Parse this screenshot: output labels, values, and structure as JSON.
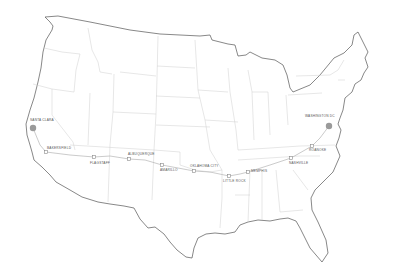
{
  "map": {
    "title": "Cross-country route map",
    "colors": {
      "background": "#ffffff",
      "coast": "#555555",
      "state_border": "#cfcfcf",
      "route": "#b5b5b5",
      "stop": "#8a8a8a",
      "endpoint": "#9a9a9a",
      "label": "#555555"
    },
    "label_note": "Stop names are inferred from blurred pixels and not legible with certainty",
    "endpoints": [
      {
        "name": "Santa Clara",
        "x": 33,
        "y": 128,
        "label_x": 30,
        "label_y": 119
      },
      {
        "name": "Washington DC",
        "x": 329,
        "y": 126,
        "label_x": 305,
        "label_y": 115
      }
    ],
    "stops": [
      {
        "name": "Bakersfield",
        "x": 46,
        "y": 152,
        "label_x": 47,
        "label_y": 148
      },
      {
        "name": "Flagstaff",
        "x": 94,
        "y": 157,
        "label_x": 90,
        "label_y": 162
      },
      {
        "name": "Albuquerque",
        "x": 129,
        "y": 159,
        "label_x": 129,
        "label_y": 154
      },
      {
        "name": "Amarillo",
        "x": 162,
        "y": 165,
        "label_x": 161,
        "label_y": 169
      },
      {
        "name": "Oklahoma City",
        "x": 194,
        "y": 171,
        "label_x": 191,
        "label_y": 166
      },
      {
        "name": "Little Rock",
        "x": 229,
        "y": 176,
        "label_x": 224,
        "label_y": 180
      },
      {
        "name": "Memphis",
        "x": 248,
        "y": 172,
        "label_x": 251,
        "label_y": 171
      },
      {
        "name": "Nashville",
        "x": 291,
        "y": 158,
        "label_x": 290,
        "label_y": 162
      },
      {
        "name": "Roanoke",
        "x": 312,
        "y": 146,
        "label_x": 309,
        "label_y": 149
      }
    ]
  }
}
